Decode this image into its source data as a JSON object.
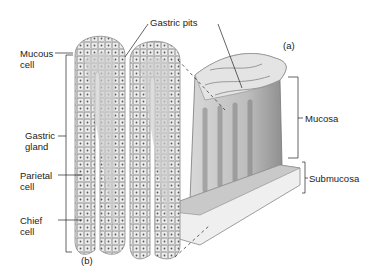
{
  "labels": {
    "gastric_pits": "Gastric pits",
    "panel_a": "(a)",
    "panel_b": "(b)",
    "mucous_cell": [
      "Mucous",
      "cell"
    ],
    "gastric_gland": [
      "Gastric",
      "gland"
    ],
    "parietal_cell": [
      "Parietal",
      "cell"
    ],
    "chief_cell": [
      "Chief",
      "cell"
    ],
    "mucosa": "Mucosa",
    "submucosa": "Submucosa"
  },
  "colors": {
    "ink": "#222222",
    "tissue_light": "#e6e6e6",
    "tissue_mid": "#b8b8b8",
    "tissue_dark": "#6a6a6a"
  }
}
